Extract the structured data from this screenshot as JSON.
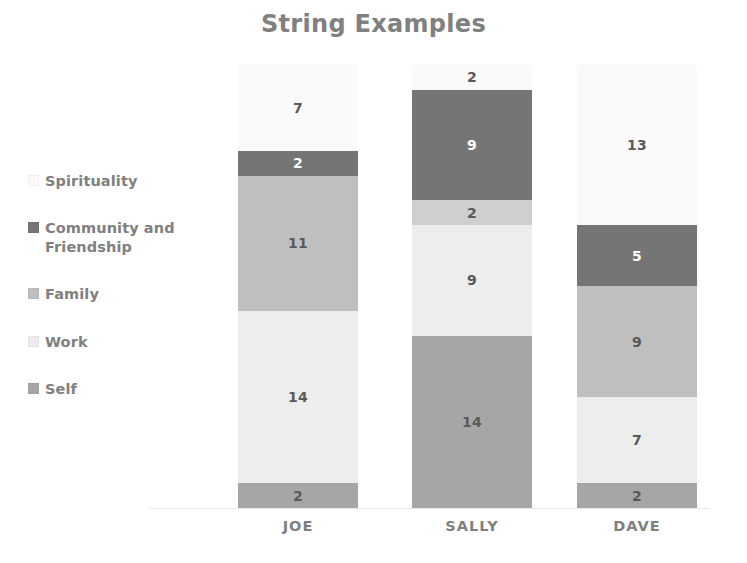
{
  "chart_data": {
    "type": "bar",
    "subtype": "stacked-bar",
    "title": "String Examples",
    "xlabel": "",
    "ylabel": "",
    "categories": [
      "JOE",
      "SALLY",
      "DAVE"
    ],
    "grid": false,
    "axis_visible": true,
    "ylim": [
      0,
      36
    ],
    "legend_position": "left",
    "stack_order_top_to_bottom": [
      "Spirituality",
      "Community and Friendship",
      "Family",
      "Work",
      "Self"
    ],
    "series": [
      {
        "name": "Self",
        "color": "#a6a6a6",
        "label_color": "#595959",
        "values": [
          2,
          14,
          2
        ]
      },
      {
        "name": "Work",
        "color": "#ededed",
        "label_color": "#595959",
        "values": [
          14,
          9,
          7
        ]
      },
      {
        "name": "Family",
        "color": "#bfbfbf",
        "label_color": "#595959",
        "values": [
          11,
          2,
          9
        ]
      },
      {
        "name": "Community and Friendship",
        "color": "#757575",
        "label_color": "#ffffff",
        "values": [
          2,
          9,
          5
        ]
      },
      {
        "name": "Spirituality",
        "color": "#fafafa",
        "label_color": "#595959",
        "values": [
          7,
          2,
          13
        ]
      }
    ],
    "totals": [
      36,
      36,
      36
    ],
    "bars": [
      {
        "category": "JOE",
        "segments": [
          {
            "name": "Spirituality",
            "value": 7,
            "color": "#fafafa",
            "label_color": "#595959"
          },
          {
            "name": "Community and Friendship",
            "value": 2,
            "color": "#757575",
            "label_color": "#ffffff"
          },
          {
            "name": "Family",
            "value": 11,
            "color": "#bfbfbf",
            "label_color": "#595959"
          },
          {
            "name": "Work",
            "value": 14,
            "color": "#ededed",
            "label_color": "#595959"
          },
          {
            "name": "Self",
            "value": 2,
            "color": "#a6a6a6",
            "label_color": "#595959"
          }
        ]
      },
      {
        "category": "SALLY",
        "segments": [
          {
            "name": "Spirituality",
            "value": 2,
            "color": "#fafafa",
            "label_color": "#595959"
          },
          {
            "name": "Community and Friendship",
            "value": 9,
            "color": "#757575",
            "label_color": "#ffffff"
          },
          {
            "name": "Family",
            "value": 2,
            "color": "#cfcfcf",
            "label_color": "#595959"
          },
          {
            "name": "Work",
            "value": 9,
            "color": "#ededed",
            "label_color": "#595959"
          },
          {
            "name": "Self",
            "value": 14,
            "color": "#a6a6a6",
            "label_color": "#595959"
          }
        ]
      },
      {
        "category": "DAVE",
        "segments": [
          {
            "name": "Spirituality",
            "value": 13,
            "color": "#fafafa",
            "label_color": "#595959"
          },
          {
            "name": "Community and Friendship",
            "value": 5,
            "color": "#757575",
            "label_color": "#ffffff"
          },
          {
            "name": "Family",
            "value": 9,
            "color": "#bfbfbf",
            "label_color": "#595959"
          },
          {
            "name": "Work",
            "value": 7,
            "color": "#ededed",
            "label_color": "#595959"
          },
          {
            "name": "Self",
            "value": 2,
            "color": "#a6a6a6",
            "label_color": "#595959"
          }
        ]
      }
    ]
  },
  "legend": {
    "items": [
      {
        "label": "Spirituality",
        "color": "#fafafa"
      },
      {
        "label": "Community and Friendship",
        "color": "#757575"
      },
      {
        "label": "Family",
        "color": "#bfbfbf"
      },
      {
        "label": "Work",
        "color": "#ededed"
      },
      {
        "label": "Self",
        "color": "#a6a6a6"
      }
    ]
  },
  "layout": {
    "bar_width": 120,
    "bar_left_positions": [
      238,
      412,
      577
    ],
    "plot_top": 65,
    "plot_bottom": 508
  }
}
